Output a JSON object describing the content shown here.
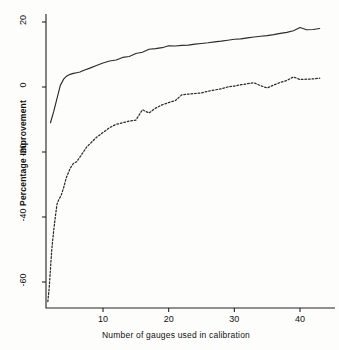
{
  "chart_data": {
    "type": "line",
    "title": "",
    "subtitle": "",
    "xlabel": "Number of gauges used in calibration",
    "ylabel": "Percentage Improvement",
    "xlim": [
      1,
      44
    ],
    "ylim": [
      -68,
      24
    ],
    "xticks": [
      10,
      20,
      30,
      40
    ],
    "ytick_labels": [
      "20",
      "0",
      "-20",
      "-40",
      "-60"
    ],
    "yticks": [
      20,
      0,
      -20,
      -40,
      -60
    ],
    "grid": false,
    "legend": "none",
    "axis_style": "left-and-bottom-spine",
    "series": [
      {
        "name": "solid-curve",
        "style": "solid",
        "color": "#2b2b2b",
        "x": [
          2,
          2.5,
          3,
          3.5,
          4,
          4.5,
          5,
          5.5,
          6,
          6.5,
          7,
          8,
          9,
          10,
          11,
          12,
          13,
          14,
          15,
          16,
          17,
          18,
          19,
          20,
          21,
          22,
          23,
          24,
          25,
          26,
          27,
          28,
          29,
          30,
          31,
          32,
          33,
          34,
          35,
          36,
          37,
          38,
          39,
          40,
          41,
          42,
          43
        ],
        "y": [
          -11,
          -7.5,
          -3.5,
          0.5,
          2.4,
          3.4,
          3.9,
          4.2,
          4.4,
          4.6,
          5.1,
          5.8,
          6.6,
          7.4,
          8.0,
          8.3,
          9.1,
          9.4,
          10.3,
          10.7,
          11.6,
          11.8,
          12.1,
          12.7,
          12.6,
          12.8,
          12.9,
          13.2,
          13.4,
          13.6,
          13.9,
          14.1,
          14.4,
          14.7,
          14.8,
          15.1,
          15.4,
          15.6,
          15.8,
          16.1,
          16.5,
          16.8,
          17.3,
          18.3,
          17.6,
          17.7,
          18.0
        ]
      },
      {
        "name": "dashed-curve",
        "style": "dashed",
        "color": "#2b2b2b",
        "x": [
          1.6,
          1.8,
          2,
          2.2,
          2.5,
          2.8,
          3,
          3.3,
          3.6,
          4,
          4.4,
          5,
          5.5,
          6,
          6.5,
          7,
          7.5,
          8,
          9,
          10,
          11,
          12,
          13,
          14,
          15,
          16,
          17,
          18,
          19,
          20,
          21,
          22,
          23,
          24,
          25,
          26,
          27,
          28,
          29,
          30,
          31,
          32,
          33,
          34,
          35,
          36,
          37,
          38,
          39,
          40,
          41,
          42,
          43
        ],
        "y": [
          -66,
          -62,
          -56,
          -50,
          -44,
          -39,
          -36,
          -34.5,
          -33.5,
          -31,
          -28,
          -25,
          -23.5,
          -23,
          -21.5,
          -20,
          -18.5,
          -17.5,
          -15.5,
          -14,
          -12.5,
          -11.5,
          -11,
          -10.5,
          -10.2,
          -7.0,
          -8.0,
          -6.5,
          -5.5,
          -4.8,
          -4.2,
          -2.4,
          -2.2,
          -2.0,
          -1.8,
          -1.3,
          -0.9,
          -0.6,
          0.0,
          0.3,
          0.7,
          1.0,
          1.3,
          0.4,
          -0.3,
          0.6,
          1.4,
          2.0,
          3.1,
          2.3,
          2.4,
          2.5,
          2.7
        ]
      }
    ]
  }
}
